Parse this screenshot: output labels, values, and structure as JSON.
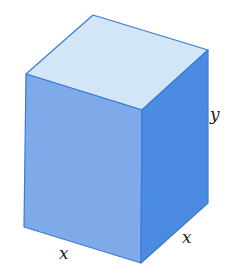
{
  "figure": {
    "type": "rectangular-box",
    "colors": {
      "front_face": "#7eaaea",
      "right_face": "#4b8be2",
      "top_face": "#d2e6f8",
      "edge": "#3a7bd5",
      "label": "#222222"
    },
    "vertices": {
      "top_back": [
        93,
        15
      ],
      "top_left": [
        26,
        74
      ],
      "top_right": [
        208,
        50
      ],
      "top_front": [
        142,
        110
      ],
      "bottom_left": [
        24,
        227
      ],
      "bottom_front": [
        141,
        263
      ],
      "bottom_right": [
        208,
        203
      ]
    },
    "labels": {
      "height": "y",
      "width_front": "x",
      "depth_right": "x"
    }
  }
}
